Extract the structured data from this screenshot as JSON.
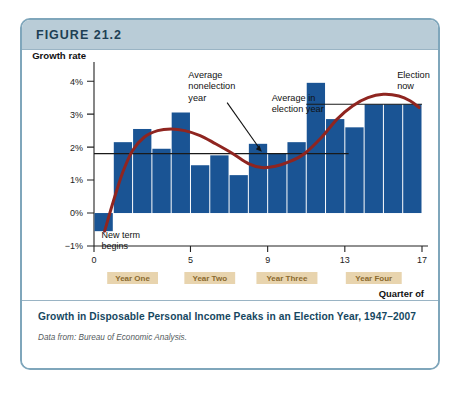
{
  "figure": {
    "number_label": "FIGURE 21.2",
    "caption_title": "Growth in Disposable Personal Income Peaks in an Election Year, 1947–2007",
    "source_note": "Data from: Bureau of Economic Analysis."
  },
  "colors": {
    "bar": "#1a5494",
    "trend_line": "#8f2520",
    "reference_line": "#1a1a1a",
    "header_bg": "#b9ccd7",
    "card_border": "#7fa6bb",
    "caption_text": "#16475f",
    "year_band_bg": "#e8d4ae",
    "year_band_text": "#8a6a2f"
  },
  "chart_data": {
    "type": "bar",
    "title": "Growth in Disposable Personal Income Peaks in an Election Year, 1947–2007",
    "xlabel": "Quarter of presidential cycle",
    "ylabel": "Growth rate",
    "x": [
      1,
      2,
      3,
      4,
      5,
      6,
      7,
      8,
      9,
      10,
      11,
      12,
      13,
      14,
      15,
      16,
      17
    ],
    "values": [
      -0.55,
      2.15,
      2.55,
      1.95,
      3.05,
      1.45,
      1.75,
      1.15,
      2.1,
      1.8,
      2.15,
      3.95,
      2.85,
      2.6,
      3.3,
      3.3,
      3.3
    ],
    "categories": [
      "1",
      "2",
      "3",
      "4",
      "5",
      "6",
      "7",
      "8",
      "9",
      "10",
      "11",
      "12",
      "13",
      "14",
      "15",
      "16",
      "17"
    ],
    "ylim": [
      -1,
      4.4
    ],
    "xlim": [
      0,
      17
    ],
    "y_ticks": [
      -1,
      0,
      1,
      2,
      3,
      4
    ],
    "y_tick_labels": [
      "−1%",
      "0%",
      "1%",
      "2%",
      "3%",
      "4%"
    ],
    "x_ticks": [
      0,
      5,
      9,
      13,
      17
    ],
    "x_tick_labels": [
      "0",
      "5",
      "9",
      "13",
      "17"
    ],
    "grid": false,
    "legend": "none",
    "reference_lines": [
      {
        "name": "average-nonelection-year",
        "value": 1.8,
        "x_start": 0,
        "x_end": 13.2,
        "label": "Average nonelection year"
      },
      {
        "name": "average-election-year",
        "value": 3.3,
        "x_start": 11.0,
        "x_end": 17.0,
        "label": "Average in election year"
      }
    ],
    "trend_series": {
      "name": "smoothed-trend",
      "points": [
        [
          0.55,
          -0.55
        ],
        [
          1.0,
          0.35
        ],
        [
          1.5,
          1.25
        ],
        [
          2.0,
          1.9
        ],
        [
          2.6,
          2.3
        ],
        [
          3.3,
          2.5
        ],
        [
          4.0,
          2.55
        ],
        [
          4.7,
          2.5
        ],
        [
          5.5,
          2.35
        ],
        [
          6.3,
          2.1
        ],
        [
          7.2,
          1.8
        ],
        [
          8.0,
          1.5
        ],
        [
          8.7,
          1.38
        ],
        [
          9.4,
          1.42
        ],
        [
          10.1,
          1.55
        ],
        [
          10.9,
          1.8
        ],
        [
          11.8,
          2.3
        ],
        [
          12.6,
          2.85
        ],
        [
          13.4,
          3.25
        ],
        [
          14.2,
          3.5
        ],
        [
          15.0,
          3.6
        ],
        [
          15.8,
          3.55
        ],
        [
          16.4,
          3.4
        ],
        [
          16.85,
          3.2
        ]
      ]
    },
    "annotations": [
      {
        "name": "new-term-begins",
        "text": "New term begins",
        "x": 0.6,
        "y": -0.75
      },
      {
        "name": "average-nonelection-year",
        "text": "Average nonelection year",
        "x": 5.2,
        "y": 4.1
      },
      {
        "name": "average-in-election-year",
        "text": "Average in election year",
        "x": 9.0,
        "y": 3.4
      },
      {
        "name": "election-now",
        "text": "Election now",
        "x": 15.4,
        "y": 4.1
      }
    ],
    "year_bands": [
      {
        "label": "Year One",
        "start": 1,
        "end": 4
      },
      {
        "label": "Year Two",
        "start": 5,
        "end": 8
      },
      {
        "label": "Year Three",
        "start": 9,
        "end": 12
      },
      {
        "label": "Year Four",
        "start": 13,
        "end": 17
      }
    ],
    "axis_caption_lines": [
      "Quarter of",
      "presidential cycle"
    ]
  }
}
